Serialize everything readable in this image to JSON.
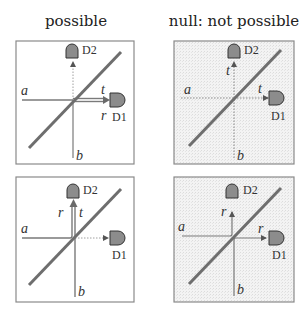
{
  "titles": {
    "left": "possible",
    "right": "null: not possible"
  },
  "panels": [
    {
      "id": "top-left",
      "shaded": false,
      "labels": {
        "a": "a",
        "b": "b",
        "d1": "D1",
        "d2": "D2",
        "t_h": "t",
        "r_h": "r"
      }
    },
    {
      "id": "top-right",
      "shaded": true,
      "labels": {
        "a": "a",
        "b": "b",
        "d1": "D1",
        "d2": "D2",
        "t_h": "t",
        "t_v": "t"
      }
    },
    {
      "id": "bottom-left",
      "shaded": false,
      "labels": {
        "a": "a",
        "b": "b",
        "d1": "D1",
        "d2": "D2",
        "r_v": "r",
        "t_v": "t"
      }
    },
    {
      "id": "bottom-right",
      "shaded": true,
      "labels": {
        "a": "a",
        "b": "b",
        "d1": "D1",
        "d2": "D2",
        "r_v": "r",
        "r_h": "r"
      }
    }
  ],
  "colors": {
    "beam": "#7a7a7a",
    "splitter": "#6e6e6e",
    "detector": "#8c8c8c",
    "frame": "#8a8a8a",
    "shade": "#efefef"
  }
}
